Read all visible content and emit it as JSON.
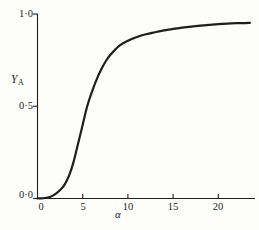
{
  "figure": {
    "background": "#fdfdfb",
    "ink_color": "#1e1e1e"
  },
  "chart_data": {
    "type": "line",
    "title": "",
    "xlabel": "α",
    "ylabel": {
      "main": "Y",
      "sub": "A"
    },
    "xlim": [
      0,
      24
    ],
    "ylim": [
      0,
      1.0
    ],
    "grid": false,
    "legend": null,
    "x_ticks": [
      {
        "value": 0,
        "label": "0"
      },
      {
        "value": 5,
        "label": "5"
      },
      {
        "value": 10,
        "label": "10"
      },
      {
        "value": 15,
        "label": "15"
      },
      {
        "value": 20,
        "label": "20"
      }
    ],
    "y_ticks": [
      {
        "value": 0.0,
        "label": "0·0"
      },
      {
        "value": 0.5,
        "label": "0·5"
      },
      {
        "value": 1.0,
        "label": "1·0"
      }
    ],
    "series": [
      {
        "name": "YA sigmoid saturation curve",
        "x": [
          0,
          0.5,
          1,
          1.5,
          2,
          2.5,
          3,
          3.5,
          4,
          4.5,
          5,
          5.5,
          6,
          6.5,
          7,
          7.5,
          8,
          9,
          10,
          11,
          12,
          13,
          14,
          15,
          16,
          17,
          18,
          19,
          20,
          21,
          22,
          23,
          23.5
        ],
        "y": [
          0,
          0.001,
          0.004,
          0.011,
          0.025,
          0.046,
          0.075,
          0.125,
          0.2,
          0.3,
          0.4,
          0.5,
          0.575,
          0.64,
          0.695,
          0.74,
          0.775,
          0.826,
          0.855,
          0.875,
          0.89,
          0.901,
          0.911,
          0.919,
          0.926,
          0.932,
          0.937,
          0.941,
          0.945,
          0.948,
          0.95,
          0.951,
          0.952
        ]
      }
    ]
  }
}
